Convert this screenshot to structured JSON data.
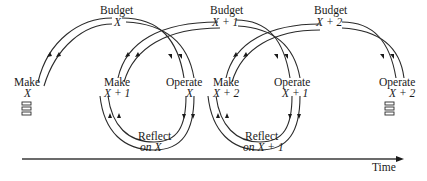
{
  "diagram": {
    "type": "cyclical budget process over time",
    "stages": {
      "budget": [
        {
          "label": "Budget",
          "var": "X"
        },
        {
          "label": "Budget",
          "var": "X + 1"
        },
        {
          "label": "Budget",
          "var": "X + 2"
        }
      ],
      "make": [
        {
          "label": "Make",
          "var": "X"
        },
        {
          "label": "Make",
          "var": "X + 1"
        },
        {
          "label": "Make",
          "var": "X + 2"
        }
      ],
      "operate": [
        {
          "label": "Operate",
          "var": "X"
        },
        {
          "label": "Operate",
          "var": "X + 1"
        },
        {
          "label": "Operate",
          "var": "X + 2"
        }
      ],
      "reflect": [
        {
          "label": "Reflect",
          "var": "on X"
        },
        {
          "label": "Reflect",
          "var": "on X + 1"
        }
      ]
    },
    "axis": {
      "label": "Time",
      "direction": "left-to-right"
    }
  }
}
